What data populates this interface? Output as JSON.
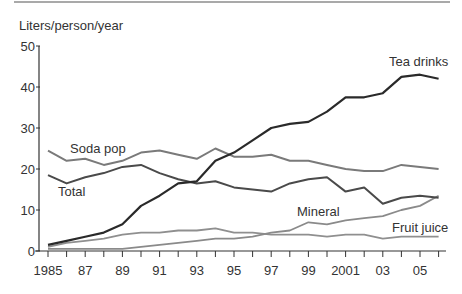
{
  "chart_data": {
    "type": "line",
    "title": "",
    "ylabel": "Liters/person/year",
    "xlabel": "",
    "ylim": [
      0,
      50
    ],
    "yticks": [
      0,
      10,
      20,
      30,
      40,
      50
    ],
    "x": [
      1985,
      1986,
      1987,
      1988,
      1989,
      1990,
      1991,
      1992,
      1993,
      1994,
      1995,
      1996,
      1997,
      1998,
      1999,
      2000,
      2001,
      2002,
      2003,
      2004,
      2005,
      2006
    ],
    "xtick_labels": [
      {
        "year": 1985,
        "label": "1985"
      },
      {
        "year": 1987,
        "label": "87"
      },
      {
        "year": 1989,
        "label": "89"
      },
      {
        "year": 1991,
        "label": "91"
      },
      {
        "year": 1993,
        "label": "93"
      },
      {
        "year": 1995,
        "label": "95"
      },
      {
        "year": 1997,
        "label": "97"
      },
      {
        "year": 1999,
        "label": "99"
      },
      {
        "year": 2001,
        "label": "2001"
      },
      {
        "year": 2003,
        "label": "03"
      },
      {
        "year": 2005,
        "label": "05"
      }
    ],
    "grid": false,
    "legend": "inline labels",
    "series": [
      {
        "name": "Tea drinks",
        "color": "#2a2a2a",
        "width": 2.2,
        "label_pos": [
          389,
          66
        ],
        "values": [
          1.5,
          2.5,
          3.5,
          4.5,
          6.5,
          11,
          13.5,
          16.5,
          17,
          22,
          24,
          27,
          30,
          31,
          31.5,
          34,
          37.5,
          37.5,
          38.5,
          42.5,
          43,
          42
        ]
      },
      {
        "name": "Soda pop",
        "color": "#7a7a7a",
        "width": 2,
        "label_pos": [
          70,
          153
        ],
        "values": [
          24.5,
          22,
          22.5,
          21,
          22,
          24,
          24.5,
          23.5,
          22.5,
          25,
          23,
          23,
          23.5,
          22,
          22,
          21,
          20,
          19.5,
          19.5,
          21,
          20.5,
          20
        ]
      },
      {
        "name": "Total",
        "color": "#4a4a4a",
        "width": 2,
        "label_pos": [
          58,
          196
        ],
        "values": [
          18.5,
          16.5,
          18,
          19,
          20.5,
          21,
          19,
          17.5,
          16.5,
          17,
          15.5,
          15,
          14.5,
          16.5,
          17.5,
          18,
          14.5,
          15.5,
          11.5,
          13,
          13.5,
          13
        ]
      },
      {
        "name": "Mineral",
        "color": "#8a8a8a",
        "width": 1.8,
        "label_pos": [
          297,
          216
        ],
        "values": [
          0.5,
          0.5,
          0.5,
          0.5,
          0.5,
          1,
          1.5,
          2,
          2.5,
          3,
          3,
          3.5,
          4.5,
          5,
          7,
          6.5,
          7.5,
          8,
          8.5,
          10,
          11,
          13.5
        ]
      },
      {
        "name": "Fruit juice",
        "color": "#8f8f8f",
        "width": 1.8,
        "label_pos": [
          392,
          232
        ],
        "values": [
          1,
          2,
          2.5,
          3,
          4,
          4.5,
          4.5,
          5,
          5,
          5.5,
          4.5,
          4.5,
          4,
          4,
          4,
          3.5,
          4,
          4,
          3,
          3.5,
          3.5,
          3.5
        ]
      }
    ]
  }
}
